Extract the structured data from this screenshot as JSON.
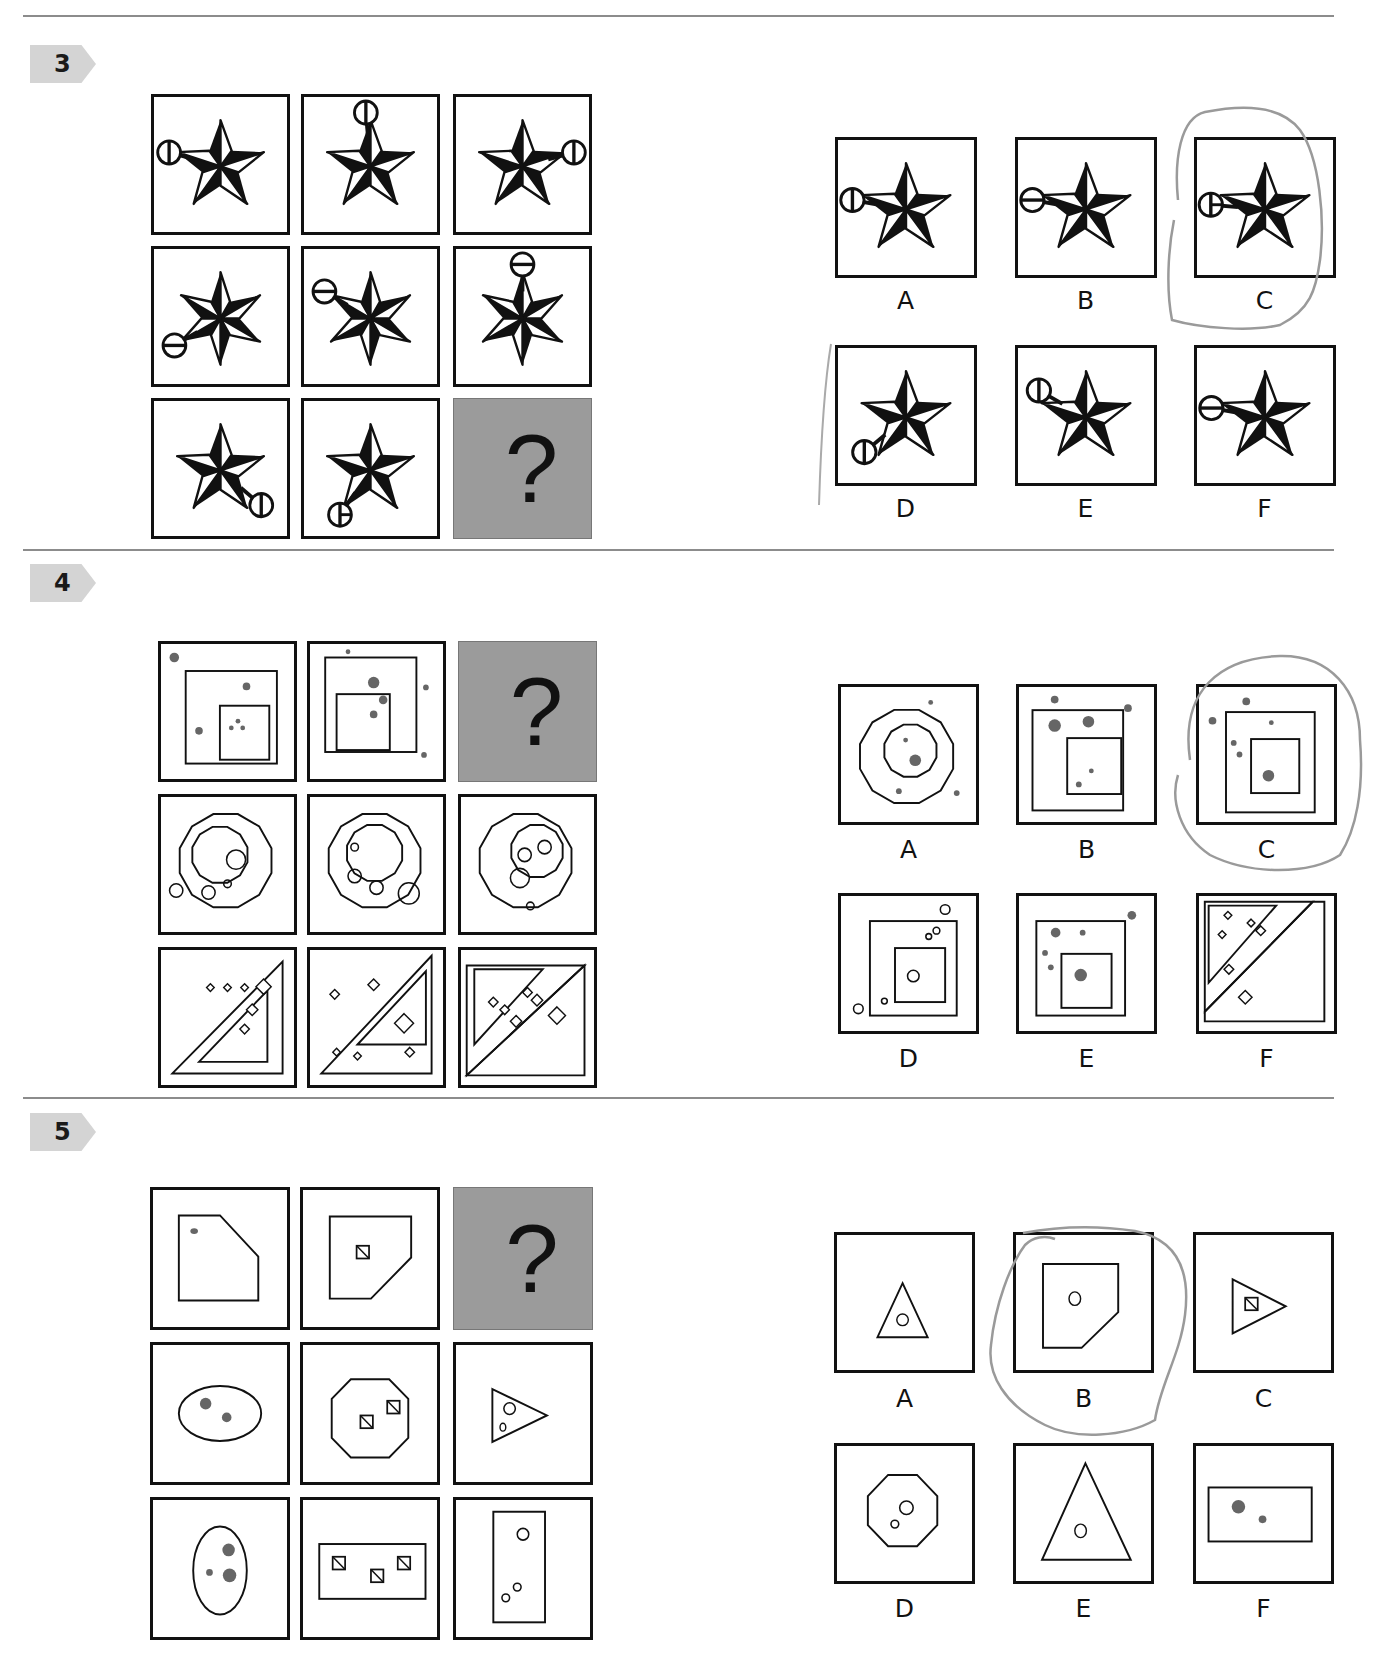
{
  "colors": {
    "rule": "#8c8c8c",
    "badge": "#d4d4d4",
    "missing_cell": "#9b9b9b",
    "dot": "#666666",
    "pencil": "#9a9a9a"
  },
  "questions": [
    {
      "number": "3",
      "missing_symbol": "?",
      "theme": "stars with pendant circle",
      "matrix": [
        "5-point star, circle left (vertical bar)",
        "5-point star, circle top (vertical bar)",
        "5-point star, circle right (vertical bar)",
        "6-point star, circle lower-left (horizontal bar)",
        "6-point star, circle upper-left (horizontal bar)",
        "6-point star, circle top (horizontal bar)",
        "5-point star, circle lower-right (vertical bar)",
        "5-point star, circle lower-left (vertical bar)",
        "?"
      ],
      "options": [
        {
          "label": "A",
          "desc": "5-point star, circle left, vertical bar"
        },
        {
          "label": "B",
          "desc": "5-point star, circle left, horizontal bar"
        },
        {
          "label": "C",
          "desc": "5-point star, circle left, half bar",
          "circled": true
        },
        {
          "label": "D",
          "desc": "5-point star, circle lower-left, vertical bar"
        },
        {
          "label": "E",
          "desc": "5-point star, circle upper-left, vertical bar"
        },
        {
          "label": "F",
          "desc": "5-point star, circle left, horizontal bar"
        }
      ]
    },
    {
      "number": "4",
      "missing_symbol": "?",
      "theme": "nested shapes with dots",
      "matrix": [
        "nested squares with grey dots",
        "nested squares with grey dots",
        "?",
        "nested dodecagons with circles",
        "nested dodecagons with circles",
        "nested dodecagons with circles",
        "nested triangles with diamonds",
        "nested triangles with diamonds",
        "nested triangles with diamonds"
      ],
      "options": [
        {
          "label": "A",
          "desc": "nested dodecagons with grey dots"
        },
        {
          "label": "B",
          "desc": "nested squares with grey dots"
        },
        {
          "label": "C",
          "desc": "nested squares with grey dots",
          "circled": true
        },
        {
          "label": "D",
          "desc": "nested squares with open circles"
        },
        {
          "label": "E",
          "desc": "nested squares with grey dots"
        },
        {
          "label": "F",
          "desc": "nested triangles with diamonds"
        }
      ]
    },
    {
      "number": "5",
      "missing_symbol": "?",
      "theme": "shapes containing small elements",
      "matrix": [
        "pentagon (cut corner) with grey dot",
        "pentagon (cut corner) with hatched square",
        "?",
        "ellipse with two grey dots",
        "octagon with two hatched squares",
        "triangle with two open circles",
        "vertical ellipse with three grey dots",
        "rectangle with three hatched squares",
        "vertical rectangle with three open circles"
      ],
      "options": [
        {
          "label": "A",
          "desc": "triangle with open circle"
        },
        {
          "label": "B",
          "desc": "pentagon (cut corner) with open circle",
          "circled": true
        },
        {
          "label": "C",
          "desc": "triangle with hatched square"
        },
        {
          "label": "D",
          "desc": "octagon with two open circles"
        },
        {
          "label": "E",
          "desc": "large triangle with open circle"
        },
        {
          "label": "F",
          "desc": "rectangle with two grey dots"
        }
      ]
    }
  ]
}
